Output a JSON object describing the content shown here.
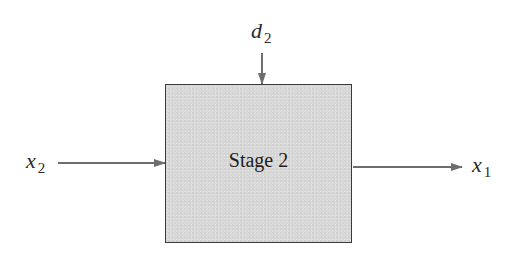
{
  "diagram": {
    "type": "block-diagram",
    "block": {
      "label": "Stage 2",
      "fill_color": "#d8d8d8",
      "border_color": "#3a3a3a"
    },
    "inputs": [
      {
        "id": "x2",
        "symbol": "x",
        "subscript": "2",
        "direction": "left-to-block"
      },
      {
        "id": "d2",
        "symbol": "d",
        "subscript": "2",
        "direction": "top-to-block"
      }
    ],
    "outputs": [
      {
        "id": "x1",
        "symbol": "x",
        "subscript": "1",
        "direction": "block-to-right"
      }
    ],
    "arrow_color": "#6e6e6e"
  }
}
